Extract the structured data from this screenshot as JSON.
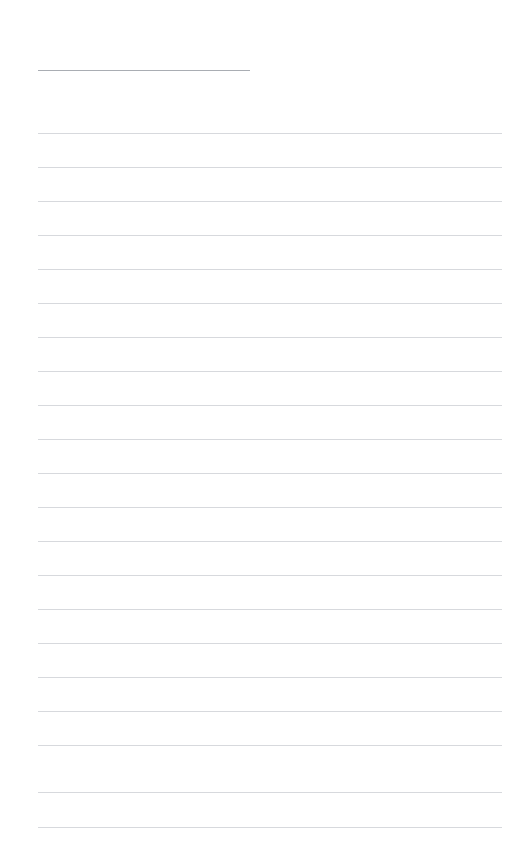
{
  "document": {
    "page_background_color": "#ffffff",
    "heading": {
      "text": "",
      "underline_color": "#a9adb3",
      "underline_left": 38,
      "underline_right": 250,
      "underline_y": 70
    },
    "rules": {
      "color": "#d7d9dd",
      "left": 38,
      "right": 502,
      "first_y": 133,
      "spacing": 34,
      "count": 21,
      "y_positions": [
        133,
        167,
        201,
        235,
        269,
        303,
        337,
        371,
        405,
        439,
        473,
        507,
        541,
        575,
        609,
        643,
        677,
        711,
        745,
        792,
        827
      ]
    },
    "lines": [
      {
        "index": 1,
        "text": ""
      },
      {
        "index": 2,
        "text": ""
      },
      {
        "index": 3,
        "text": ""
      },
      {
        "index": 4,
        "text": ""
      },
      {
        "index": 5,
        "text": ""
      },
      {
        "index": 6,
        "text": ""
      },
      {
        "index": 7,
        "text": ""
      },
      {
        "index": 8,
        "text": ""
      },
      {
        "index": 9,
        "text": ""
      },
      {
        "index": 10,
        "text": ""
      },
      {
        "index": 11,
        "text": ""
      },
      {
        "index": 12,
        "text": ""
      },
      {
        "index": 13,
        "text": ""
      },
      {
        "index": 14,
        "text": ""
      },
      {
        "index": 15,
        "text": ""
      },
      {
        "index": 16,
        "text": ""
      },
      {
        "index": 17,
        "text": ""
      },
      {
        "index": 18,
        "text": ""
      },
      {
        "index": 19,
        "text": ""
      },
      {
        "index": 20,
        "text": ""
      },
      {
        "index": 21,
        "text": ""
      }
    ]
  }
}
